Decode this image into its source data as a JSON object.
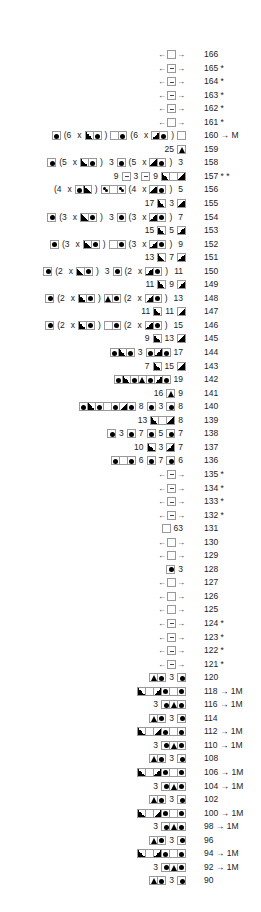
{
  "chart_data": {
    "type": "table",
    "title": "",
    "legend_symbols": {
      "E": "empty square",
      "M": "square with minus",
      "D": "square with black dot",
      "L": "half-black triangle lower-left (rising)",
      "R": "half-black triangle lower-right (falling)",
      "T": "square with black triangle",
      "S": "square with scattered dots",
      "Q": "square with special symbol"
    },
    "rows": [
      {
        "row": "166",
        "suffix": "",
        "tokens": [
          "<",
          "E",
          ">"
        ]
      },
      {
        "row": "165",
        "suffix": "*",
        "tokens": [
          "<",
          "M",
          ">"
        ]
      },
      {
        "row": "164",
        "suffix": "*",
        "tokens": [
          "<",
          "M",
          ">"
        ]
      },
      {
        "row": "163",
        "suffix": "*",
        "tokens": [
          "<",
          "M",
          ">"
        ]
      },
      {
        "row": "162",
        "suffix": "*",
        "tokens": [
          "<",
          "M",
          ">"
        ]
      },
      {
        "row": "161",
        "suffix": "*",
        "tokens": [
          "<",
          "E",
          ">"
        ]
      },
      {
        "row": "160",
        "suffix": "→ M",
        "tokens": [
          "D",
          "(6",
          "x",
          "L",
          "D",
          ")",
          "E",
          "D",
          "(6",
          "x",
          "R",
          "D",
          ")",
          "E"
        ]
      },
      {
        "row": "159",
        "suffix": "",
        "tokens": [
          "25",
          "T"
        ]
      },
      {
        "row": "158",
        "suffix": "",
        "tokens": [
          "D",
          "(5",
          "x",
          "L",
          "D",
          ")",
          "3",
          "D",
          "(5",
          "x",
          "R",
          "D",
          ")",
          "3"
        ]
      },
      {
        "row": "157",
        "suffix": "* *",
        "tokens": [
          "9",
          "M",
          "3",
          "M",
          "9",
          "L",
          "E",
          "R"
        ]
      },
      {
        "row": "156",
        "suffix": "",
        "tokens": [
          "(4",
          "x",
          "D",
          "L",
          ")",
          "S",
          "E",
          "S",
          "(4",
          "x",
          "R",
          "D",
          ")",
          "5"
        ]
      },
      {
        "row": "155",
        "suffix": "",
        "tokens": [
          "17",
          "L",
          "3",
          "R"
        ]
      },
      {
        "row": "154",
        "suffix": "",
        "tokens": [
          "D",
          "(3",
          "x",
          "L",
          "D",
          ")",
          "3",
          "D",
          "(3",
          "x",
          "R",
          "D",
          ")",
          "7"
        ]
      },
      {
        "row": "153",
        "suffix": "",
        "tokens": [
          "15",
          "L",
          "5",
          "R"
        ]
      },
      {
        "row": "152",
        "suffix": "",
        "tokens": [
          "D",
          "(3",
          "x",
          "L",
          "D",
          ")",
          "E",
          "D",
          "(3",
          "x",
          "R",
          "D",
          ")",
          "9"
        ]
      },
      {
        "row": "151",
        "suffix": "",
        "tokens": [
          "13",
          "L",
          "7",
          "R"
        ]
      },
      {
        "row": "150",
        "suffix": "",
        "tokens": [
          "D",
          "(2",
          "x",
          "L",
          "D",
          ")",
          "3",
          "D",
          "(2",
          "x",
          "R",
          "D",
          ")",
          "11"
        ]
      },
      {
        "row": "149",
        "suffix": "",
        "tokens": [
          "11",
          "L",
          "9",
          "R"
        ]
      },
      {
        "row": "148",
        "suffix": "",
        "tokens": [
          "D",
          "(2",
          "x",
          "L",
          "D",
          ")",
          "T",
          "D",
          "(2",
          "x",
          "R",
          "D",
          ")",
          "13"
        ]
      },
      {
        "row": "147",
        "suffix": "",
        "tokens": [
          "11",
          "L",
          "11",
          "R"
        ]
      },
      {
        "row": "146",
        "suffix": "",
        "tokens": [
          "D",
          "(2",
          "x",
          "L",
          "D",
          ")",
          "E",
          "D",
          "(2",
          "x",
          "R",
          "D",
          ")",
          "15"
        ]
      },
      {
        "row": "145",
        "suffix": "",
        "tokens": [
          "9",
          "L",
          "13",
          "R"
        ]
      },
      {
        "row": "144",
        "suffix": "",
        "tokens": [
          "D",
          "L",
          "D",
          "3",
          "D",
          "R",
          "D",
          "17"
        ]
      },
      {
        "row": "143",
        "suffix": "",
        "tokens": [
          "7",
          "L",
          "15",
          "R"
        ]
      },
      {
        "row": "142",
        "suffix": "",
        "tokens": [
          "D",
          "L",
          "D",
          "T",
          "D",
          "R",
          "D",
          "19"
        ]
      },
      {
        "row": "141",
        "suffix": "",
        "tokens": [
          "16",
          "T",
          "9"
        ]
      },
      {
        "row": "140",
        "suffix": "",
        "tokens": [
          "D",
          "L",
          "D",
          "E",
          "D",
          "R",
          "D",
          "8",
          "D",
          "3",
          "D",
          "8"
        ]
      },
      {
        "row": "139",
        "suffix": "",
        "tokens": [
          "13",
          "L",
          "E",
          "R",
          "8"
        ]
      },
      {
        "row": "138",
        "suffix": "",
        "tokens": [
          "D",
          "3",
          "D",
          "7",
          "D",
          "5",
          "D",
          "7"
        ]
      },
      {
        "row": "137",
        "suffix": "",
        "tokens": [
          "10",
          "L",
          "3",
          "R",
          "7"
        ]
      },
      {
        "row": "136",
        "suffix": "",
        "tokens": [
          "D",
          "E",
          "D",
          "6",
          "D",
          "7",
          "D",
          "6"
        ]
      },
      {
        "row": "135",
        "suffix": "*",
        "tokens": [
          "<",
          "M",
          ">"
        ]
      },
      {
        "row": "134",
        "suffix": "*",
        "tokens": [
          "<",
          "M",
          ">"
        ]
      },
      {
        "row": "133",
        "suffix": "*",
        "tokens": [
          "<",
          "M",
          ">"
        ]
      },
      {
        "row": "132",
        "suffix": "*",
        "tokens": [
          "<",
          "M",
          ">"
        ]
      },
      {
        "row": "131",
        "suffix": "",
        "tokens": [
          "Q",
          "63"
        ]
      },
      {
        "row": "130",
        "suffix": "",
        "tokens": [
          "<",
          "E",
          ">"
        ]
      },
      {
        "row": "129",
        "suffix": "",
        "tokens": [
          "<",
          "E",
          ">"
        ]
      },
      {
        "row": "128",
        "suffix": "",
        "tokens": [
          "D",
          "3"
        ]
      },
      {
        "row": "127",
        "suffix": "",
        "tokens": [
          "<",
          "E",
          ">"
        ]
      },
      {
        "row": "126",
        "suffix": "",
        "tokens": [
          "<",
          "E",
          ">"
        ]
      },
      {
        "row": "125",
        "suffix": "",
        "tokens": [
          "<",
          "E",
          ">"
        ]
      },
      {
        "row": "124",
        "suffix": "*",
        "tokens": [
          "<",
          "M",
          ">"
        ]
      },
      {
        "row": "123",
        "suffix": "*",
        "tokens": [
          "<",
          "M",
          ">"
        ]
      },
      {
        "row": "122",
        "suffix": "*",
        "tokens": [
          "<",
          "M",
          ">"
        ]
      },
      {
        "row": "121",
        "suffix": "*",
        "tokens": [
          "<",
          "M",
          ">"
        ]
      },
      {
        "row": "120",
        "suffix": "",
        "tokens": [
          "T",
          "D",
          "3",
          "D"
        ]
      },
      {
        "row": "118",
        "suffix": "→ 1M",
        "tokens": [
          "L",
          "E",
          "R",
          "D",
          "E",
          "D"
        ]
      },
      {
        "row": "116",
        "suffix": "→ 1M",
        "tokens": [
          "3",
          "D",
          "T",
          "D"
        ]
      },
      {
        "row": "114",
        "suffix": "",
        "tokens": [
          "T",
          "D",
          "3",
          "D"
        ]
      },
      {
        "row": "112",
        "suffix": "→ 1M",
        "tokens": [
          "L",
          "E",
          "R",
          "D",
          "E",
          "D"
        ]
      },
      {
        "row": "110",
        "suffix": "→ 1M",
        "tokens": [
          "3",
          "D",
          "T",
          "D"
        ]
      },
      {
        "row": "108",
        "suffix": "",
        "tokens": [
          "T",
          "D",
          "3",
          "D"
        ]
      },
      {
        "row": "106",
        "suffix": "→ 1M",
        "tokens": [
          "L",
          "E",
          "R",
          "D",
          "E",
          "D"
        ]
      },
      {
        "row": "104",
        "suffix": "→ 1M",
        "tokens": [
          "3",
          "D",
          "T",
          "D"
        ]
      },
      {
        "row": "102",
        "suffix": "",
        "tokens": [
          "T",
          "D",
          "3",
          "D"
        ]
      },
      {
        "row": "100",
        "suffix": "→ 1M",
        "tokens": [
          "L",
          "E",
          "R",
          "D",
          "E",
          "D"
        ]
      },
      {
        "row": "98",
        "suffix": "→ 1M",
        "tokens": [
          "3",
          "D",
          "T",
          "D"
        ]
      },
      {
        "row": "96",
        "suffix": "",
        "tokens": [
          "T",
          "D",
          "3",
          "D"
        ]
      },
      {
        "row": "94",
        "suffix": "→ 1M",
        "tokens": [
          "L",
          "E",
          "R",
          "D",
          "E",
          "D"
        ]
      },
      {
        "row": "92",
        "suffix": "→ 1M",
        "tokens": [
          "3",
          "D",
          "T",
          "D"
        ]
      },
      {
        "row": "90",
        "suffix": "",
        "tokens": [
          "T",
          "D",
          "3",
          "D"
        ]
      }
    ]
  },
  "colors": {
    "ink": "#000000",
    "cell_border": "#999999",
    "text": "#222222"
  }
}
